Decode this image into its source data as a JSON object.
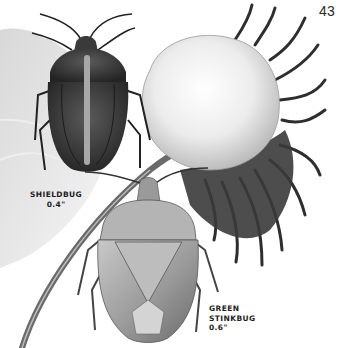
{
  "page": {
    "number": "43",
    "background": "#ffffff",
    "tone": "grayscale field-guide illustration"
  },
  "illustrations": [
    {
      "id": "shieldbug",
      "subject": "Shieldbug on cotton boll stem",
      "caption": {
        "name": "SHIELDBUG",
        "size": "0.4\""
      }
    },
    {
      "id": "green-stinkbug",
      "subject": "Green stinkbug on cotton stem",
      "caption": {
        "name_line1": "GREEN",
        "name_line2": "STINKBUG",
        "size": "0.6\""
      }
    },
    {
      "id": "cotton-boll",
      "subject": "Open cotton boll with spiky bracts"
    }
  ],
  "colors": {
    "ink": "#1e1e1e",
    "dark_shell": "#3a3a3a",
    "light_shell": "#a8a8a8",
    "cotton": "#f2f2f2",
    "bracts": "#2e2e2e"
  }
}
